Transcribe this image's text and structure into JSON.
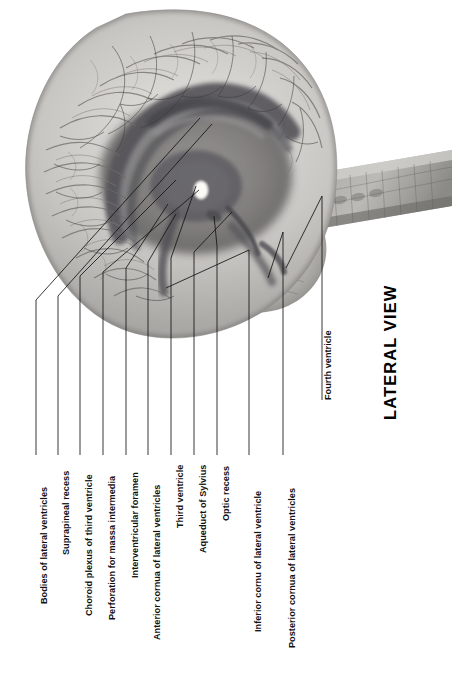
{
  "plate": {
    "title": "LATERAL VIEW",
    "subject": "brain-ventricular-system",
    "orientation": "labels rotated 90 degrees counter-clockwise",
    "colors": {
      "background": "#ffffff",
      "ink": "#111111",
      "tissue_light": "#d8d6d2",
      "tissue_mid": "#a8a6a2",
      "tissue_dark": "#6e6c69",
      "ventricle_dark": "#57565a",
      "leader_line": "#1a1a1a"
    }
  },
  "labels": [
    {
      "id": "bodies-of-lateral-ventricles",
      "text": "Bodies of lateral ventricles"
    },
    {
      "id": "suprapineal-recess",
      "text": "Suprapineal recess"
    },
    {
      "id": "choroid-plexus-of-third-ventricle",
      "text": "Choroid plexus of third ventricle"
    },
    {
      "id": "perforation-for-massa-intermedia",
      "text": "Perforation for massa intermedia"
    },
    {
      "id": "interventricular-foramen",
      "text": "Interventricular foramen"
    },
    {
      "id": "anterior-cornua-of-lateral-ventricles",
      "text": "Anterior cornua of lateral ventricles"
    },
    {
      "id": "third-ventricle",
      "text": "Third ventricle"
    },
    {
      "id": "aqueduct-of-sylvius",
      "text": "Aqueduct of Sylvius"
    },
    {
      "id": "optic-recess",
      "text": "Optic recess"
    },
    {
      "id": "inferior-cornu-of-lateral-ventricle",
      "text": "Inferior cornu of lateral ventricle"
    },
    {
      "id": "posterior-cornua-of-lateral-ventricles",
      "text": "Posterior cornua of lateral ventricles"
    },
    {
      "id": "fourth-ventricle",
      "text": "Fourth ventricle"
    }
  ]
}
